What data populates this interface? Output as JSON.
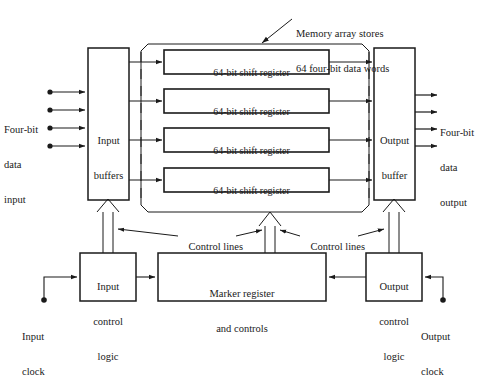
{
  "figure": {
    "background_color": "#ffffff",
    "line_color": "#1a1a1a"
  },
  "annotations": {
    "memory_array_note_line1": "Memory array stores",
    "memory_array_note_line2": "64 four-bit data words"
  },
  "io": {
    "input_label_line1": "Four-bit",
    "input_label_line2": "data",
    "input_label_line3": "input",
    "output_label_line1": "Four-bit",
    "output_label_line2": "data",
    "output_label_line3": "output",
    "input_bit_count": 4,
    "output_bit_count": 4
  },
  "blocks": {
    "input_buffers_line1": "Input",
    "input_buffers_line2": "buffers",
    "output_buffer_line1": "Output",
    "output_buffer_line2": "buffer",
    "input_control_line1": "Input",
    "input_control_line2": "control",
    "input_control_line3": "logic",
    "output_control_line1": "Output",
    "output_control_line2": "control",
    "output_control_line3": "logic",
    "marker_register_line1": "Marker register",
    "marker_register_line2": "and controls"
  },
  "memory_array": {
    "register_label": "64-bit shift register",
    "registers": [
      "64-bit shift register",
      "64-bit shift register",
      "64-bit shift register",
      "64-bit shift register"
    ]
  },
  "control_lines": {
    "left_label": "Control lines",
    "right_label": "Control lines"
  },
  "clocks": {
    "input_clock_line1": "Input",
    "input_clock_line2": "clock",
    "output_clock_line1": "Output",
    "output_clock_line2": "clock"
  }
}
